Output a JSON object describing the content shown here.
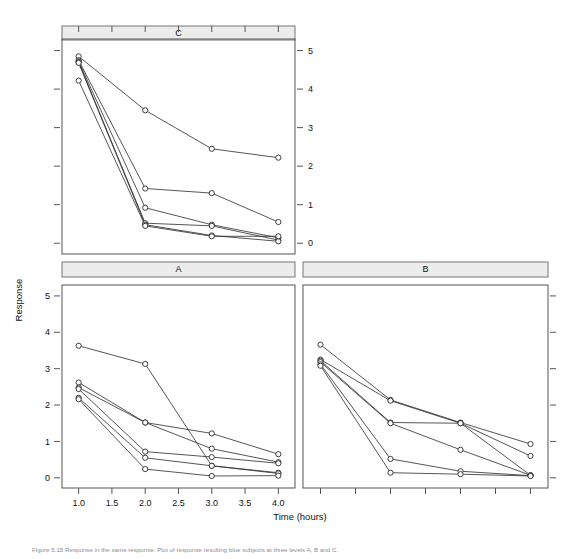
{
  "figure": {
    "title": "",
    "xlabel": "Time (hours)",
    "ylabel": "Response",
    "caption": "Figure 5.15   Response in the same response. Plot of response resulting blue subjects at three levels A, B and C."
  },
  "panels": {
    "top_left_label": "C",
    "bottom_left_label": "A",
    "bottom_right_label": "B"
  },
  "axes": {
    "y_ticks": [
      "0",
      "1",
      "2",
      "3",
      "4",
      "5"
    ],
    "x_ticks": [
      "1.0",
      "1.5",
      "2.0",
      "2.5",
      "3.0",
      "3.5",
      "4.0"
    ],
    "ylim_low": 0,
    "ylim_high": 5,
    "xlim_low": 1.0,
    "xlim_high": 4.0
  },
  "chart_data": {
    "type": "line",
    "title": "",
    "xlabel": "Time (hours)",
    "ylabel": "Response",
    "xlim": [
      0.75,
      4.25
    ],
    "ylim": [
      -0.28,
      5.3
    ],
    "x_tick_values": [
      1.0,
      1.5,
      2.0,
      2.5,
      3.0,
      3.5,
      4.0
    ],
    "x_tick_labels": [
      "1.0",
      "1.5",
      "2.0",
      "2.5",
      "3.0",
      "3.5",
      "4.0"
    ],
    "y_tick_values": [
      0,
      1,
      2,
      3,
      4,
      5
    ],
    "y_tick_labels": [
      "0",
      "1",
      "2",
      "3",
      "4",
      "5"
    ],
    "grid": false,
    "legend": "none",
    "marker": "open-circle",
    "layout": "trellis-3-panel",
    "panel_order": [
      "C",
      "A",
      "B"
    ],
    "panels": [
      {
        "name": "C",
        "position": "top-left",
        "strip_label": "C",
        "y_axis_side": "right",
        "x_axis_side": "top",
        "x": [
          1.0,
          2.0,
          3.0,
          4.0
        ],
        "series": [
          {
            "name": "subject-1",
            "values": [
              4.85,
              3.45,
              2.45,
              2.22
            ]
          },
          {
            "name": "subject-2",
            "values": [
              4.75,
              1.42,
              1.3,
              0.55
            ]
          },
          {
            "name": "subject-3",
            "values": [
              4.72,
              0.92,
              0.48,
              0.14
            ]
          },
          {
            "name": "subject-4",
            "values": [
              4.7,
              0.52,
              0.45,
              0.08
            ]
          },
          {
            "name": "subject-5",
            "values": [
              4.68,
              0.48,
              0.2,
              0.05
            ]
          },
          {
            "name": "subject-6",
            "values": [
              4.22,
              0.45,
              0.18,
              0.18
            ]
          }
        ]
      },
      {
        "name": "A",
        "position": "bottom-left",
        "strip_label": "A",
        "y_axis_side": "left",
        "x_axis_side": "bottom",
        "x": [
          1.0,
          2.0,
          3.0,
          4.0
        ],
        "series": [
          {
            "name": "subject-1",
            "values": [
              3.63,
              3.13,
              0.33,
              0.14
            ]
          },
          {
            "name": "subject-2",
            "values": [
              2.62,
              1.52,
              1.22,
              0.65
            ]
          },
          {
            "name": "subject-3",
            "values": [
              2.48,
              1.52,
              0.8,
              0.43
            ]
          },
          {
            "name": "subject-4",
            "values": [
              2.44,
              0.72,
              0.57,
              0.4
            ]
          },
          {
            "name": "subject-5",
            "values": [
              2.2,
              0.55,
              0.33,
              0.12
            ]
          },
          {
            "name": "subject-6",
            "values": [
              2.16,
              0.24,
              0.05,
              0.06
            ]
          }
        ]
      },
      {
        "name": "B",
        "position": "bottom-right",
        "strip_label": "B",
        "y_axis_side": "none",
        "x_axis_side": "bottom",
        "x": [
          1.0,
          2.0,
          3.0,
          4.0
        ],
        "series": [
          {
            "name": "subject-1",
            "values": [
              3.66,
              2.14,
              1.52,
              0.93
            ]
          },
          {
            "name": "subject-2",
            "values": [
              3.25,
              2.12,
              1.5,
              0.6
            ]
          },
          {
            "name": "subject-3",
            "values": [
              3.22,
              1.52,
              1.5,
              0.07
            ]
          },
          {
            "name": "subject-4",
            "values": [
              3.18,
              1.5,
              0.77,
              0.07
            ]
          },
          {
            "name": "subject-5",
            "values": [
              3.12,
              0.52,
              0.18,
              0.06
            ]
          },
          {
            "name": "subject-6",
            "values": [
              3.08,
              0.14,
              0.1,
              0.05
            ]
          }
        ]
      }
    ]
  }
}
